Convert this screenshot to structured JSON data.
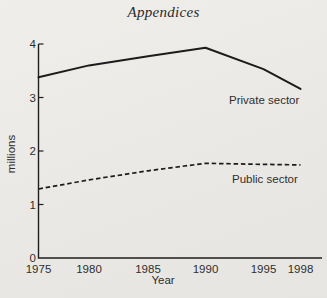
{
  "page": {
    "title": "Appendices"
  },
  "colors": {
    "background": "#ebe9e6",
    "ink": "#1f1f1f",
    "text": "#2e2e2e"
  },
  "chart_data": {
    "type": "line",
    "x": [
      1975,
      1980,
      1985,
      1990,
      1995,
      1998
    ],
    "xlabel": "Year",
    "ylabel": "millions",
    "ylim": [
      0,
      4
    ],
    "yticks": [
      0,
      1,
      2,
      3,
      4
    ],
    "grid": false,
    "legend_position": "inline-labels",
    "series": [
      {
        "name": "Private sector",
        "style": "solid",
        "values": [
          3.38,
          3.6,
          3.77,
          3.93,
          3.53,
          3.16
        ]
      },
      {
        "name": "Public sector",
        "style": "dashed",
        "values": [
          1.29,
          1.46,
          1.63,
          1.77,
          1.75,
          1.74
        ]
      }
    ]
  }
}
